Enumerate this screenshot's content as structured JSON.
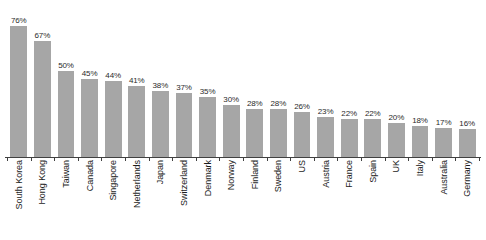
{
  "chart_data": {
    "type": "bar",
    "title": "",
    "subtitle": "",
    "xlabel": "",
    "ylabel": "",
    "ylim": [
      0,
      80
    ],
    "grid": false,
    "legend": null,
    "orientation": "vertical",
    "value_label_suffix": "%",
    "bar_color": "#a6a6a6",
    "axis_color": "#404040",
    "background_color": "#ffffff",
    "categories": [
      "South Korea",
      "Hong Kong",
      "Taiwan",
      "Canada",
      "Singapore",
      "Netherlands",
      "Japan",
      "Switzerland",
      "Denmark",
      "Norway",
      "Finland",
      "Sweden",
      "US",
      "Austria",
      "France",
      "Spain",
      "UK",
      "Italy",
      "Australia",
      "Germany"
    ],
    "values": [
      76,
      67,
      50,
      45,
      44,
      41,
      38,
      37,
      35,
      30,
      28,
      28,
      26,
      23,
      22,
      22,
      20,
      18,
      17,
      16
    ],
    "value_labels": [
      "76%",
      "67%",
      "50%",
      "45%",
      "44%",
      "41%",
      "38%",
      "37%",
      "35%",
      "30%",
      "28%",
      "28%",
      "26%",
      "23%",
      "22%",
      "22%",
      "20%",
      "18%",
      "17%",
      "16%"
    ]
  }
}
